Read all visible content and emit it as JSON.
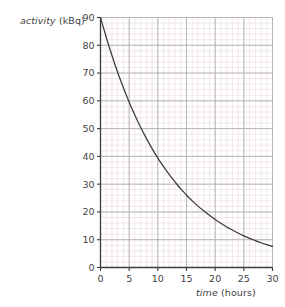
{
  "chart_data": {
    "type": "line",
    "title": "",
    "subtitle": "",
    "xlabel_italic": "time",
    "xlabel_rest": " (hours)",
    "ylabel_italic": "activity",
    "ylabel_rest": " (kBq)",
    "xlabel": "time (hours)",
    "ylabel": "activity (kBq)",
    "xlim": [
      0,
      30
    ],
    "ylim": [
      0,
      90
    ],
    "x_major_ticks": [
      0,
      5,
      10,
      15,
      20,
      25,
      30
    ],
    "y_major_ticks": [
      0,
      10,
      20,
      30,
      40,
      50,
      60,
      70,
      80,
      90
    ],
    "x_minor_step": 1,
    "y_minor_step": 2,
    "grid": true,
    "grid_major": true,
    "grid_minor": true,
    "legend": "none",
    "annotations": [],
    "series": [
      {
        "name": "activity",
        "x": [
          0,
          1,
          2,
          3,
          4,
          5,
          6,
          7,
          8,
          9,
          10,
          11,
          12,
          13,
          14,
          15,
          16,
          17,
          18,
          19,
          20,
          21,
          22,
          23,
          24,
          25,
          26,
          27,
          28,
          29,
          30
        ],
        "values": [
          90.0,
          82.9,
          76.3,
          70.2,
          64.7,
          59.5,
          54.8,
          50.5,
          46.5,
          42.8,
          39.4,
          36.3,
          33.4,
          30.8,
          28.3,
          26.1,
          24.0,
          22.1,
          20.4,
          18.8,
          17.3,
          15.9,
          14.6,
          13.5,
          12.4,
          11.4,
          10.5,
          9.7,
          8.9,
          8.2,
          7.6
        ]
      }
    ],
    "colors": {
      "curve": "#3a3a3a",
      "axis": "#3a3a3a",
      "grid_major": "#a8a8a8",
      "grid_minor": "#eddede",
      "background": "#ffffff",
      "text": "#3f3f3f"
    }
  }
}
